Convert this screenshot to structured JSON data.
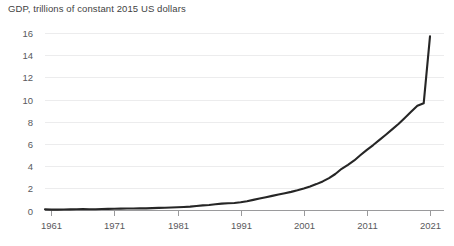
{
  "chart_data": {
    "type": "line",
    "title": "GDP, trillions of constant 2015 US dollars",
    "xlabel": "",
    "ylabel": "",
    "xlim": [
      1960,
      2021
    ],
    "ylim": [
      0,
      16
    ],
    "grid": true,
    "legend": null,
    "legend_position": "none",
    "line_color": "#262626",
    "grid_color": "#ececed",
    "axis_color": "#9a9a9c",
    "ytick_labels": [
      "0",
      "2",
      "4",
      "6",
      "8",
      "10",
      "12",
      "14",
      "16"
    ],
    "ytick_values": [
      0,
      2,
      4,
      6,
      8,
      10,
      12,
      14,
      16
    ],
    "xtick_labels": [
      "1961",
      "1971",
      "1981",
      "1991",
      "2001",
      "2011",
      "2021"
    ],
    "xtick_values": [
      1961,
      1971,
      1981,
      1991,
      2001,
      2011,
      2021
    ],
    "series": [
      {
        "name": "GDP",
        "x": [
          1960,
          1961,
          1962,
          1963,
          1964,
          1965,
          1966,
          1967,
          1968,
          1969,
          1970,
          1971,
          1972,
          1973,
          1974,
          1975,
          1976,
          1977,
          1978,
          1979,
          1980,
          1981,
          1982,
          1983,
          1984,
          1985,
          1986,
          1987,
          1988,
          1989,
          1990,
          1991,
          1992,
          1993,
          1994,
          1995,
          1996,
          1997,
          1998,
          1999,
          2000,
          2001,
          2002,
          2003,
          2004,
          2005,
          2006,
          2007,
          2008,
          2009,
          2010,
          2011,
          2012,
          2013,
          2014,
          2015,
          2016,
          2017,
          2018,
          2019,
          2020,
          2021
        ],
        "values": [
          0.1,
          0.08,
          0.08,
          0.09,
          0.1,
          0.11,
          0.12,
          0.11,
          0.11,
          0.13,
          0.15,
          0.16,
          0.17,
          0.18,
          0.18,
          0.2,
          0.19,
          0.21,
          0.24,
          0.25,
          0.27,
          0.29,
          0.32,
          0.35,
          0.41,
          0.46,
          0.5,
          0.56,
          0.62,
          0.65,
          0.68,
          0.74,
          0.84,
          0.96,
          1.08,
          1.2,
          1.32,
          1.44,
          1.56,
          1.68,
          1.82,
          1.98,
          2.16,
          2.38,
          2.62,
          2.92,
          3.29,
          3.76,
          4.12,
          4.51,
          5.0,
          5.47,
          5.9,
          6.36,
          6.83,
          7.31,
          7.8,
          8.34,
          8.9,
          9.44,
          9.66,
          15.7
        ]
      }
    ]
  }
}
